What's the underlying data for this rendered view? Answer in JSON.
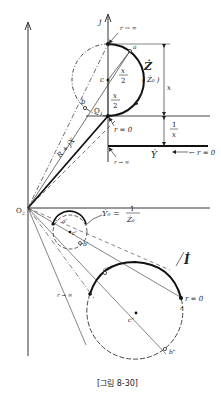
{
  "figure": {
    "caption": "[그림 8-30]",
    "colors": {
      "ink": "#222222",
      "paper": "#ffffff"
    }
  },
  "impedance_plane": {
    "axis_label_j": "j",
    "origin_label": "O",
    "origin_sub": "1",
    "origin2_label": "O",
    "origin2_sub": "2",
    "label_r_inf_top": "r → ∞",
    "label_r_zero": "r = 0",
    "label_Z": "Ż",
    "label_Z0": "( Ż₀ )",
    "label_x_num": "x",
    "label_x_den": "2",
    "label_x_num2": "x",
    "label_x_den2": "2",
    "point_a": "a",
    "point_b": "b",
    "point_c": "c",
    "dim_x": "x",
    "vector_label": "R + jX"
  },
  "admittance_line": {
    "dim_num": "1",
    "dim_den": "x",
    "label_Y": "Ẏ",
    "label_r_zero": "← r = 0",
    "label_r_inf": "r → ∞"
  },
  "inverted_circle": {
    "label_Y0": "Ẏ₀ =",
    "frac_num": "1",
    "frac_den": "Ż₀",
    "point_a": "a'",
    "point_b": "b'",
    "point_c": "c'"
  },
  "current_circle": {
    "label_I": "İ",
    "label_r_zero": "r = 0",
    "label_r_inf": "r → ∞",
    "point_a": "a\"",
    "point_b": "b\"",
    "point_c": "c\"",
    "point_r": "r"
  }
}
